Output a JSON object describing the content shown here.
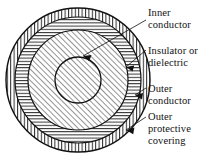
{
  "figure": {
    "background_color": "#ffffff",
    "line_color": "#111111"
  },
  "diagram": {
    "type": "concentric-cross-section",
    "center": {
      "x": 78,
      "y": 80
    },
    "layers": [
      {
        "id": "outer-protective-covering",
        "label": "Outer protective covering",
        "hatch": "radial-vertical",
        "outer_radius": 72,
        "inner_radius": 63
      },
      {
        "id": "outer-conductor",
        "label": "Outer conductor",
        "hatch": "horizontal",
        "outer_radius": 63,
        "inner_radius": 50
      },
      {
        "id": "insulator-or-dielectric",
        "label": "Insulator or dielectric",
        "hatch": "diagonal-right",
        "outer_radius": 50,
        "inner_radius": 23
      },
      {
        "id": "inner-conductor",
        "label": "Inner conductor",
        "hatch": "diagonal-right",
        "outer_radius": 23,
        "inner_radius": 0
      }
    ]
  },
  "callouts": [
    {
      "id": "inner-conductor",
      "line1": "Inner",
      "line2": "conductor",
      "line3": "",
      "text_x": 148,
      "text_y": 16,
      "arrow_tip": {
        "x": 83,
        "y": 56
      }
    },
    {
      "id": "insulator-or-dielectric",
      "line1": "Insulator or",
      "line2": "dielectric",
      "line3": "",
      "text_x": 148,
      "text_y": 54,
      "arrow_tip": {
        "x": 126,
        "y": 67
      }
    },
    {
      "id": "outer-conductor",
      "line1": "Outer",
      "line2": "conductor",
      "line3": "",
      "text_x": 148,
      "text_y": 92,
      "arrow_tip": {
        "x": 135,
        "y": 95
      }
    },
    {
      "id": "outer-protective-covering",
      "line1": "Outer",
      "line2": "protective",
      "line3": "covering",
      "text_x": 148,
      "text_y": 120,
      "arrow_tip": {
        "x": 126,
        "y": 130
      }
    }
  ]
}
